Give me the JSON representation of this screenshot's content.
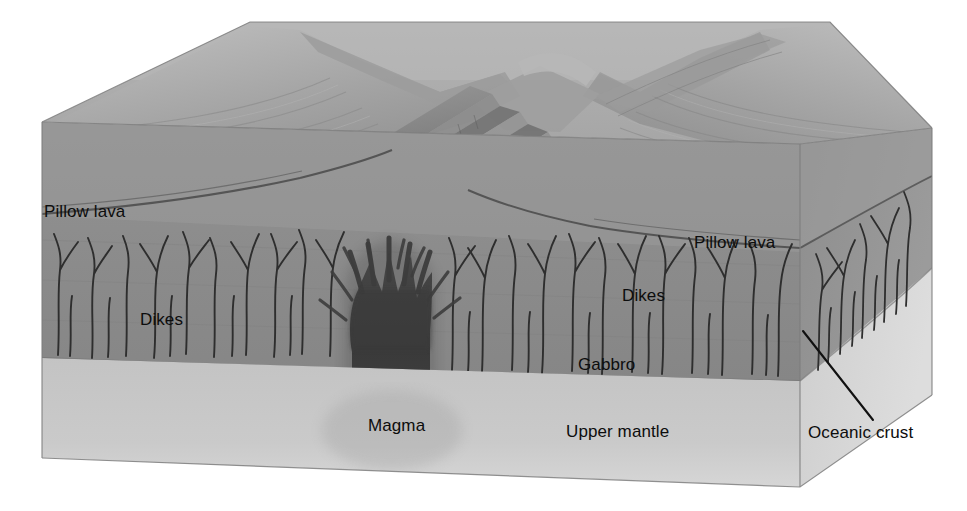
{
  "figure": {
    "width": 967,
    "height": 511
  },
  "labels": [
    {
      "key": "pillow_lava_left",
      "text": "Pillow lava",
      "x": 44,
      "y": 203
    },
    {
      "key": "dikes_left",
      "text": "Dikes",
      "x": 140,
      "y": 311
    },
    {
      "key": "pillow_lava_right",
      "text": "Pillow lava",
      "x": 694,
      "y": 234
    },
    {
      "key": "dikes_right",
      "text": "Dikes",
      "x": 622,
      "y": 287
    },
    {
      "key": "gabbro",
      "text": "Gabbro",
      "x": 578,
      "y": 356
    },
    {
      "key": "magma",
      "text": "Magma",
      "x": 368,
      "y": 417
    },
    {
      "key": "upper_mantle",
      "text": "Upper mantle",
      "x": 566,
      "y": 423
    },
    {
      "key": "oceanic_crust",
      "text": "Oceanic crust",
      "x": 808,
      "y": 424
    }
  ],
  "leader_line": {
    "name": "oceanic-crust-leader",
    "x1": 803,
    "y1": 331,
    "x2": 873,
    "y2": 420,
    "stroke": "#111111",
    "stroke_width": 2.1
  },
  "palette": {
    "background": "#ffffff",
    "seafloor_top": "#b6b6b6",
    "seafloor_top_far": "#aaaaaa",
    "crust_front": "#8b8b8b",
    "crust_front_dark": "#7d7d7d",
    "crust_side": "#929292",
    "mantle_front": "#c6c6c6",
    "mantle_side": "#d0d0d0",
    "magma": "#3b3b3b",
    "magma_edge": "#4a4a4a",
    "dike_stroke": "#2c2c2c",
    "outline": "#6f6f6f",
    "label_text": "#0d0d0d",
    "ridge_shade": "#7a7a7a",
    "ridge_light": "#c2c2c2"
  },
  "geometry": {
    "block_top_back_left": {
      "x": 42,
      "y": 122
    },
    "block_top_back_apex": {
      "x": 250,
      "y": 22
    },
    "block_top_back_right": {
      "x": 830,
      "y": 22
    },
    "block_top_right_front": {
      "x": 932,
      "y": 128
    },
    "block_front_left": {
      "x": 42,
      "y": 458
    },
    "block_front_right": {
      "x": 800,
      "y": 487
    },
    "block_right_bottom": {
      "x": 932,
      "y": 395
    },
    "crust_base_left_y": 358,
    "crust_base_right_y": 380,
    "pillow_base_left_y": 215,
    "pillow_base_right_y": 250
  },
  "features": {
    "rift_valley": {
      "name": "axial-rift-valley",
      "description": "central down-dropped graben between two fault-stepped ridge flanks"
    },
    "left_flank": {
      "name": "ridge-flank-left"
    },
    "right_flank": {
      "name": "ridge-flank-right"
    },
    "magma_chamber": {
      "name": "magma-chamber"
    },
    "dike_swarm_left": {
      "name": "sheeted-dike-swarm-left",
      "count": 14
    },
    "dike_swarm_center": {
      "name": "sheeted-dike-swarm-center",
      "count": 16
    },
    "dike_swarm_right_face": {
      "name": "sheeted-dike-swarm-right-face",
      "count": 9
    }
  }
}
